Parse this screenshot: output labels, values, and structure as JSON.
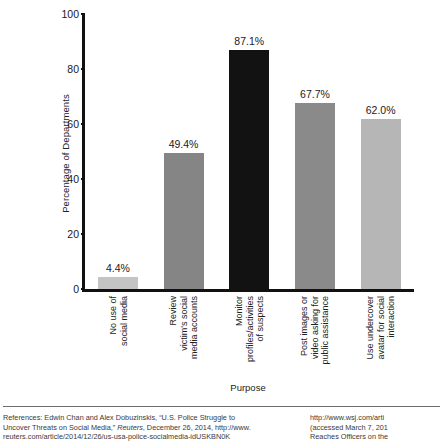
{
  "chart_data": {
    "type": "bar",
    "title": "",
    "xlabel": "Purpose",
    "ylabel": "Percentage of Departments",
    "ylim": [
      0,
      100
    ],
    "yticks": [
      0,
      20,
      40,
      60,
      80,
      100
    ],
    "grid": false,
    "legend": "none",
    "categories": [
      "No use of\nsocial media",
      "Review\nvictim's social\nmedia accounts",
      "Monitor\nprofiles/activities\nof suspects",
      "Post images or\nvideo asking for\npublic assistance",
      "Use undercover\navatar for social\ninteraction"
    ],
    "values": [
      4.4,
      49.4,
      87.1,
      67.7,
      62.0
    ],
    "value_labels": [
      "4.4%",
      "49.4%",
      "87.1%",
      "67.7%",
      "62.0%"
    ],
    "bar_colors": [
      "#c4c4c4",
      "#858585",
      "#121212",
      "#8a8a8a",
      "#b6b6b6"
    ]
  },
  "footer": {
    "left_lines": [
      "References: Edwin Chan and Alex Dobuzinskis, “U.S. Police Struggle to",
      "Uncover Threats on Social Media,” Reuters, December 26, 2014, http://www.",
      "reuters.com/article/2014/12/26/us-usa-police-socialmedia-idUSKBN0K"
    ],
    "right_lines": [
      "http://www.wsj.com/arti",
      "(accessed March 7, 201",
      "Reaches Officers on the"
    ]
  }
}
